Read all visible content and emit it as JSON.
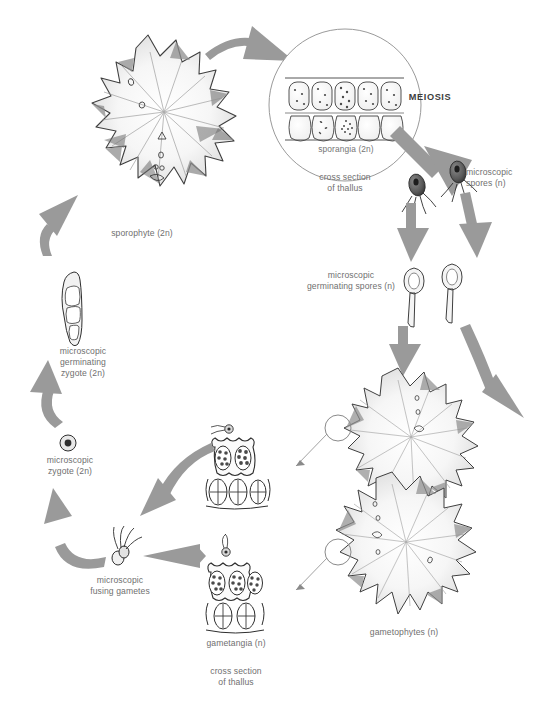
{
  "figure": {
    "background_color": "#ffffff",
    "arrow_color": "#9a9a9a",
    "label_color": "#6f6f6f",
    "ink_color": "#3a3a3a"
  },
  "labels": {
    "sporophyte": "sporophyte (2n)",
    "sporangia": "sporangia (2n)",
    "cross_section_top": "cross section\nof thallus",
    "meiosis": "MEIOSIS",
    "microscopic_spores": "microscopic\nspores (n)",
    "germinating_spores": "microscopic\ngerminating spores (n)",
    "gametophytes": "gametophytes (n)",
    "gametangia": "gametangia (n)",
    "cross_section_bottom": "cross section\nof thallus",
    "fusing_gametes": "microscopic\nfusing gametes",
    "zygote": "microscopic\nzygote (2n)",
    "germinating_zygote": "microscopic\ngerminating\nzygote (2n)"
  },
  "stages": [
    {
      "id": "sporophyte",
      "name": "sporophyte",
      "ploidy": "2n",
      "label": "sporophyte (2n)"
    },
    {
      "id": "sporangia",
      "name": "sporangia",
      "ploidy": "2n",
      "label": "sporangia (2n)"
    },
    {
      "id": "spores",
      "name": "microscopic spores",
      "ploidy": "n",
      "label": "microscopic spores (n)"
    },
    {
      "id": "germinating-spores",
      "name": "microscopic germinating spores",
      "ploidy": "n",
      "label": "microscopic germinating spores (n)"
    },
    {
      "id": "gametophytes",
      "name": "gametophytes",
      "ploidy": "n",
      "label": "gametophytes (n)"
    },
    {
      "id": "gametangia",
      "name": "gametangia",
      "ploidy": "n",
      "label": "gametangia (n)"
    },
    {
      "id": "fusing-gametes",
      "name": "microscopic fusing gametes",
      "ploidy": "n",
      "label": "microscopic fusing gametes"
    },
    {
      "id": "zygote",
      "name": "microscopic zygote",
      "ploidy": "2n",
      "label": "microscopic zygote (2n)"
    },
    {
      "id": "germinating-zygote",
      "name": "microscopic germinating zygote",
      "ploidy": "2n",
      "label": "microscopic germinating zygote (2n)"
    }
  ],
  "processes": [
    {
      "id": "meiosis",
      "label": "MEIOSIS",
      "from": "sporangia",
      "to": "spores"
    }
  ]
}
